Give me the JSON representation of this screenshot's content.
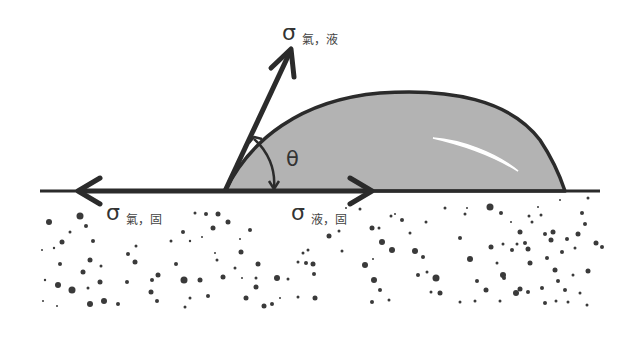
{
  "colors": {
    "droplet_fill": "#b3b3b3",
    "line": "#2b2b2b",
    "particles": "#3a3a3a",
    "background": "#ffffff"
  },
  "labels": {
    "gas_liquid": {
      "symbol": "σ",
      "subscript": "氣，液"
    },
    "gas_solid": {
      "symbol": "σ",
      "subscript": "氣，固"
    },
    "liquid_solid": {
      "symbol": "σ",
      "subscript": "液，固"
    },
    "contact_angle": "θ"
  },
  "elements": {
    "surface": "solid substrate with speckled particles",
    "droplet": "gray liquid droplet with highlight",
    "arrows": [
      "gas-liquid tension (up-right)",
      "gas-solid tension (left)",
      "liquid-solid tension (right)"
    ]
  }
}
